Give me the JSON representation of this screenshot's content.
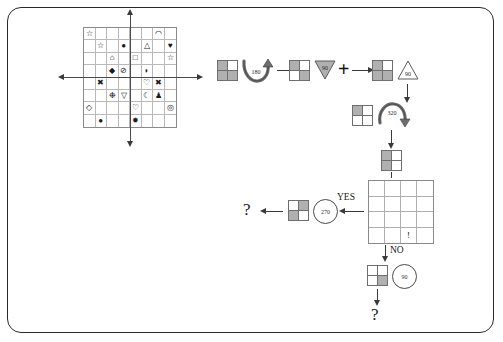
{
  "diagram": {
    "big_grid": {
      "name": "symbol-grid",
      "rows": 8,
      "cols": 8,
      "axis": {
        "horizontal": true,
        "vertical": true
      },
      "cells": [
        "☆",
        "",
        "",
        "",
        "",
        "",
        "◠",
        "",
        "",
        "☆",
        "",
        "●",
        "",
        "△",
        "",
        "♥",
        "",
        "",
        "⌂",
        "",
        "□",
        "",
        "",
        "☆",
        "",
        "",
        "◆",
        "⊘",
        "",
        "◗",
        "",
        "",
        "",
        "✖",
        "",
        "",
        "",
        "♡",
        "✖",
        "",
        "",
        "",
        "❉",
        "▽",
        "",
        "☾",
        "♟",
        "",
        "◇",
        "",
        "",
        "",
        "♡",
        "",
        "",
        "◎",
        "",
        "●",
        "",
        "",
        "✹",
        "",
        "",
        ""
      ]
    },
    "flow": {
      "step1": {
        "grid_name": "grid-step-1",
        "fills": [
          "gray",
          "white",
          "gray",
          "gray"
        ],
        "rotate_badge": "180",
        "rotate_icon": "curved-rotation-arrow"
      },
      "step2": {
        "grid_name": "grid-step-2",
        "fills": [
          "gray",
          "white",
          "white",
          "gray"
        ],
        "triangle_down_label": "90",
        "plus_label": "+"
      },
      "step3": {
        "grid_name": "grid-step-3",
        "fills": [
          "gray",
          "white",
          "gray",
          "gray"
        ],
        "triangle_up_label": "90"
      },
      "step4": {
        "grid_name": "grid-step-4",
        "fills": [
          "gray",
          "white",
          "white",
          "white"
        ],
        "rotate_badge": "320",
        "rotate_icon": "curved-rotation-arrow"
      },
      "step5": {
        "grid_name": "grid-step-5",
        "fills": [
          "gray",
          "white",
          "gray",
          "white"
        ]
      },
      "decision_grid": {
        "grid_name": "grid-4x4-decision",
        "rows": 4,
        "cols": 4,
        "marker": "!",
        "marker_row": 4,
        "marker_col": 3
      },
      "yes_branch": {
        "label": "YES",
        "circle_label": "270",
        "grid_name": "grid-yes-result",
        "fills": [
          "white",
          "gray",
          "gray",
          "white"
        ],
        "question": "?"
      },
      "no_branch": {
        "label": "NO",
        "circle_label": "90",
        "grid_name": "grid-no-result",
        "fills": [
          "white",
          "white",
          "white",
          "gray"
        ],
        "question": "?"
      }
    },
    "colors": {
      "fill_gray": "#b0b0b0",
      "fill_white": "#ffffff",
      "stroke": "#6e6e6e",
      "frame": "#2a2a2a"
    }
  }
}
